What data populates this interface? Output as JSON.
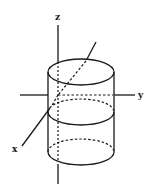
{
  "diagram": {
    "labels": {
      "z": "z",
      "y": "y",
      "x": "x"
    },
    "colors": {
      "stroke": "#1a1a1a",
      "background": "#ffffff"
    },
    "shapes": {
      "cylinder": {
        "center_x": 81,
        "radius_x": 33,
        "radius_y": 13,
        "top_y": 72,
        "middle_y": 112,
        "bottom_y": 152
      }
    }
  }
}
